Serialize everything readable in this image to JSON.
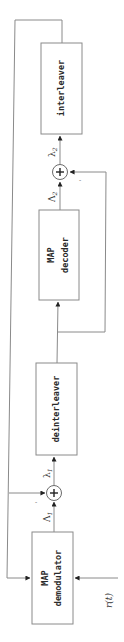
{
  "diagram": {
    "colors": {
      "line": "#8a8a8a",
      "text": "#2a2a2a",
      "background": "#ffffff"
    },
    "blocks": {
      "interleaver": {
        "line1": "interleaver"
      },
      "map_decoder": {
        "line1": "MAP",
        "line2": "decoder"
      },
      "deinterleaver": {
        "line1": "deinterleaver"
      },
      "map_demodulator": {
        "line1": "MAP",
        "line2": "demodulator"
      }
    },
    "adders": {
      "adder1": {
        "symbol": "+",
        "minus_mark": "-"
      },
      "adder2": {
        "symbol": "+",
        "minus_mark": "-"
      }
    },
    "signals": {
      "Lambda1": {
        "base": "Λ",
        "sub": "1"
      },
      "lambda1": {
        "base": "λ",
        "sub": "1"
      },
      "Lambda2": {
        "base": "Λ",
        "sub": "2"
      },
      "lambda2": {
        "base": "λ",
        "sub": "2"
      },
      "input": "r(t)"
    }
  }
}
